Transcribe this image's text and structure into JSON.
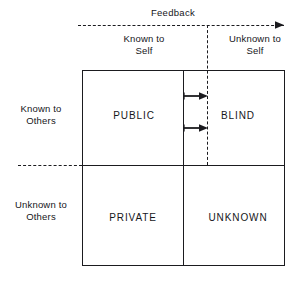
{
  "diagram": {
    "title_text": "Feedback",
    "columns": [
      {
        "id": "known-self",
        "label": "Known to\nSelf"
      },
      {
        "id": "unknown-self",
        "label": "Unknown to\nSelf"
      }
    ],
    "rows": [
      {
        "id": "known-others",
        "label": "Known to\nOthers"
      },
      {
        "id": "unknown-others",
        "label": "Unknown to\nOthers"
      }
    ],
    "quadrants": [
      {
        "id": "public",
        "label": "PUBLIC",
        "row": "known-others",
        "column": "known-self"
      },
      {
        "id": "blind",
        "label": "BLIND",
        "row": "known-others",
        "column": "unknown-self"
      },
      {
        "id": "private",
        "label": "PRIVATE",
        "row": "unknown-others",
        "column": "known-self"
      },
      {
        "id": "unknown",
        "label": "UNKNOWN",
        "row": "unknown-others",
        "column": "unknown-self"
      }
    ],
    "colors": {
      "line": "#1b1b1f",
      "text": "#16161a",
      "background": "#ffffff"
    }
  }
}
